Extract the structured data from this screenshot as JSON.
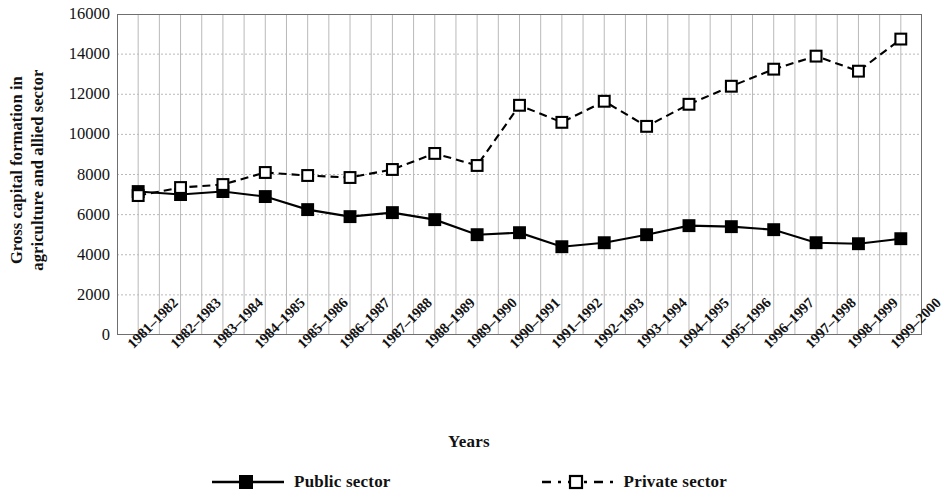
{
  "chart_data": {
    "type": "line",
    "title": "",
    "xlabel": "Years",
    "ylabel": "Gross capital formation in agriculture and allied sector",
    "ylabel_lines": [
      "Gross capital formation in",
      "agriculture and allied sector"
    ],
    "ylim": [
      0,
      16000
    ],
    "ytick_values": [
      0,
      2000,
      4000,
      6000,
      8000,
      10000,
      12000,
      14000,
      16000
    ],
    "ytick_labels": [
      "0",
      "2000",
      "4000",
      "6000",
      "8000",
      "10000",
      "12000",
      "14000",
      "16000"
    ],
    "grid": true,
    "legend_position": "bottom",
    "categories": [
      "1981–1982",
      "1982–1983",
      "1983–1984",
      "1984–1985",
      "1985–1986",
      "1986–1987",
      "1987–1988",
      "1988–1989",
      "1989–1990",
      "1990–1991",
      "1991–1992",
      "1992–1993",
      "1993–1994",
      "1994–1995",
      "1995–1996",
      "1996–1997",
      "1997–1998",
      "1998–1999",
      "1999–2000"
    ],
    "series": [
      {
        "name": "Public sector",
        "marker": "filled-square",
        "linestyle": "solid",
        "color": "#000000",
        "values": [
          7150,
          7000,
          7150,
          6900,
          6250,
          5900,
          6100,
          5750,
          5000,
          5100,
          4400,
          4600,
          5000,
          5450,
          5400,
          5250,
          4600,
          4550,
          4800
        ]
      },
      {
        "name": "Private sector",
        "marker": "open-square",
        "linestyle": "dashed",
        "color": "#000000",
        "values": [
          6950,
          7350,
          7500,
          8100,
          7950,
          7850,
          8250,
          9050,
          8450,
          11450,
          10600,
          11650,
          10400,
          11500,
          12400,
          13250,
          13900,
          13150,
          14750
        ]
      }
    ]
  },
  "legend": {
    "items": [
      {
        "label": "Public sector",
        "marker": "filled-square",
        "linestyle": "solid"
      },
      {
        "label": "Private sector",
        "marker": "open-square",
        "linestyle": "dashed"
      }
    ]
  },
  "axis": {
    "x_title": "Years"
  },
  "colors": {
    "ink": "#000000",
    "grid": "#b9b9b9",
    "background": "#ffffff"
  }
}
